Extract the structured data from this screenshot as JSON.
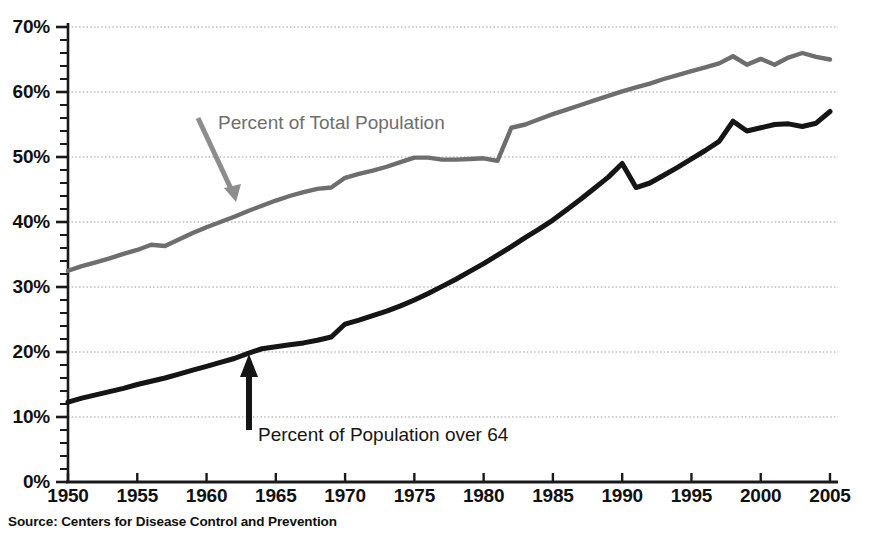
{
  "source_note": "Source: Centers for Disease Control and Prevention",
  "annotations": {
    "gray_series": "Percent of Total Population",
    "black_series": "Percent of Population over 64"
  },
  "chart_data": {
    "type": "line",
    "title": "",
    "subtitle": "",
    "xlabel": "",
    "ylabel": "",
    "xlim": [
      1950,
      2005
    ],
    "ylim": [
      0,
      70
    ],
    "grid": true,
    "legend_position": "inline-annotations",
    "y_tick_labels": [
      "0%",
      "10%",
      "20%",
      "30%",
      "40%",
      "50%",
      "60%",
      "70%"
    ],
    "y_tick_values": [
      0,
      10,
      20,
      30,
      40,
      50,
      60,
      70
    ],
    "y_minor_tick_step": 2,
    "x_tick_labels": [
      "1950",
      "1955",
      "1960",
      "1965",
      "1970",
      "1975",
      "1980",
      "1985",
      "1990",
      "1995",
      "2000",
      "2005"
    ],
    "x_tick_values": [
      1950,
      1955,
      1960,
      1965,
      1970,
      1975,
      1980,
      1985,
      1990,
      1995,
      2000,
      2005
    ],
    "x": [
      1950,
      1951,
      1952,
      1953,
      1954,
      1955,
      1956,
      1957,
      1958,
      1959,
      1960,
      1961,
      1962,
      1963,
      1964,
      1965,
      1966,
      1967,
      1968,
      1969,
      1970,
      1971,
      1972,
      1973,
      1974,
      1975,
      1976,
      1977,
      1978,
      1979,
      1980,
      1981,
      1982,
      1983,
      1984,
      1985,
      1986,
      1987,
      1988,
      1989,
      1990,
      1991,
      1992,
      1993,
      1994,
      1995,
      1996,
      1997,
      1998,
      1999,
      2000,
      2001,
      2002,
      2003,
      2004,
      2005
    ],
    "series": [
      {
        "name": "Percent of Total Population",
        "color": "#6e6e6e",
        "values": [
          32.5,
          33.2,
          33.8,
          34.4,
          35.1,
          35.7,
          36.5,
          36.3,
          37.3,
          38.3,
          39.2,
          40.0,
          40.8,
          41.7,
          42.5,
          43.3,
          44.0,
          44.6,
          45.1,
          45.3,
          46.8,
          47.4,
          47.9,
          48.5,
          49.2,
          49.9,
          49.9,
          49.6,
          49.6,
          49.7,
          49.8,
          49.4,
          54.5,
          55.0,
          55.8,
          56.6,
          57.3,
          58.0,
          58.7,
          59.4,
          60.1,
          60.7,
          61.3,
          62.0,
          62.6,
          63.2,
          63.8,
          64.4,
          65.5,
          64.2,
          65.1,
          64.2,
          65.3,
          66.0,
          65.4,
          65.0
        ]
      },
      {
        "name": "Percent of Population over 64",
        "color": "#151515",
        "values": [
          12.3,
          12.9,
          13.4,
          13.9,
          14.4,
          15.0,
          15.5,
          16.0,
          16.6,
          17.2,
          17.8,
          18.4,
          19.0,
          19.8,
          20.5,
          20.8,
          21.1,
          21.4,
          21.8,
          22.3,
          24.3,
          24.9,
          25.6,
          26.3,
          27.1,
          28.0,
          29.0,
          30.1,
          31.2,
          32.4,
          33.6,
          34.9,
          36.2,
          37.6,
          38.9,
          40.3,
          41.9,
          43.5,
          45.2,
          46.9,
          49.0,
          45.3,
          46.0,
          47.2,
          48.4,
          49.7,
          51.0,
          52.4,
          55.5,
          54.0,
          54.5,
          55.0,
          55.1,
          54.7,
          55.2,
          57.0
        ]
      }
    ]
  }
}
